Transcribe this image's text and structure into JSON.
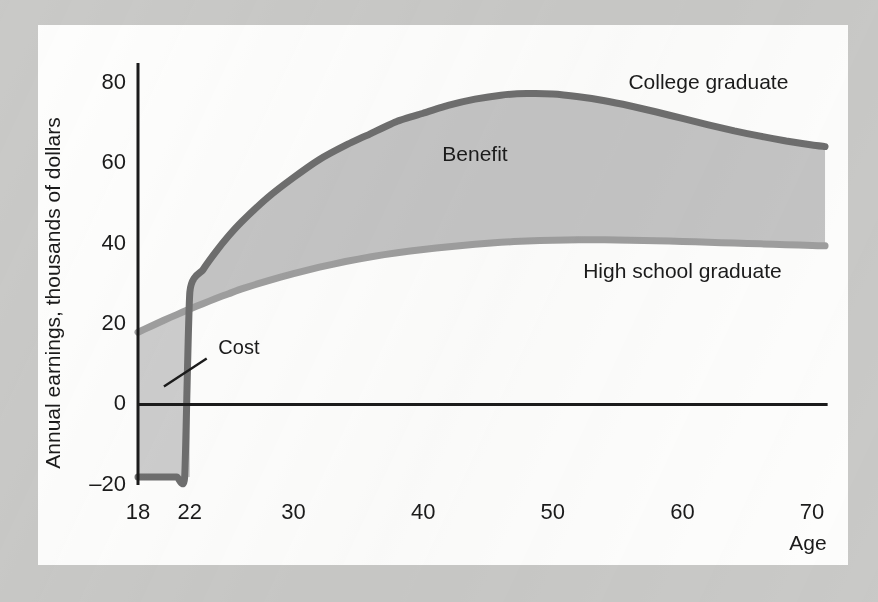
{
  "figure": {
    "background_color": "#c9c9c7",
    "panel_color": "#fdfdfc"
  },
  "chart_data": {
    "type": "line",
    "title": "",
    "subtitle": "",
    "xlabel": "Age",
    "ylabel": "Annual earnings, thousands of dollars",
    "xlim": [
      18,
      72
    ],
    "ylim": [
      -20,
      85
    ],
    "grid": false,
    "legend_position": "inline-right",
    "x_ticks": [
      18,
      22,
      30,
      40,
      50,
      60,
      70
    ],
    "x_tick_labels": [
      "18",
      "22",
      "30",
      "40",
      "50",
      "60",
      "70"
    ],
    "y_ticks": [
      -20,
      0,
      20,
      40,
      60,
      80
    ],
    "y_tick_labels": [
      "–20",
      "0",
      "20",
      "40",
      "60",
      "80"
    ],
    "zero_line": 0,
    "series": [
      {
        "name": "College graduate",
        "color": "#6e6e6e",
        "x": [
          18,
          19,
          20,
          21,
          21.6,
          22,
          23,
          24,
          25,
          26,
          28,
          30,
          32,
          34,
          36,
          38,
          40,
          42,
          44,
          46,
          48,
          50,
          52,
          54,
          56,
          58,
          60,
          62,
          64,
          66,
          68,
          70,
          71
        ],
        "y": [
          -18,
          -18,
          -18,
          -18,
          -18,
          28,
          33.5,
          38,
          42,
          45.5,
          51.5,
          56.5,
          61,
          64.5,
          67.5,
          70.5,
          72.5,
          74.5,
          76,
          77,
          77.4,
          77.3,
          76.6,
          75.6,
          74.3,
          72.8,
          71.2,
          69.6,
          68.1,
          66.8,
          65.6,
          64.6,
          64.2
        ]
      },
      {
        "name": "High school graduate",
        "color": "#9e9e9e",
        "x": [
          18,
          19,
          20,
          21,
          22,
          23,
          24,
          25,
          26,
          28,
          30,
          32,
          34,
          36,
          38,
          40,
          42,
          44,
          46,
          48,
          50,
          52,
          54,
          56,
          58,
          60,
          62,
          64,
          66,
          68,
          70,
          71
        ],
        "y": [
          18,
          19.5,
          21,
          22.4,
          23.8,
          25.1,
          26.4,
          27.6,
          28.8,
          30.8,
          32.6,
          34.2,
          35.6,
          36.8,
          37.8,
          38.6,
          39.3,
          39.9,
          40.4,
          40.7,
          40.9,
          41,
          41,
          40.9,
          40.8,
          40.6,
          40.4,
          40.2,
          40,
          39.8,
          39.6,
          39.5
        ]
      }
    ],
    "regions": [
      {
        "name": "Benefit",
        "label": "Benefit",
        "fill_color": "#c4c4c4",
        "description": "Area between the college graduate curve and the high school graduate curve from age 22 to 71"
      },
      {
        "name": "Cost",
        "label": "Cost",
        "fill_color": "#cdcdcd",
        "description": "Area between the high school graduate curve and the college graduate curve from age 18 to 22, including forgone earnings and direct costs down to –20"
      }
    ],
    "annotations": [
      {
        "name": "cost-callout",
        "text": "Cost",
        "x": 24.2,
        "y": 14,
        "leader_from": [
          23.3,
          11.5
        ],
        "leader_to": [
          20.0,
          4.5
        ]
      },
      {
        "name": "benefit-label",
        "text": "Benefit",
        "x": 44,
        "y": 62
      },
      {
        "name": "college-graduate-label",
        "text": "College graduate",
        "x": 62,
        "y": 80
      },
      {
        "name": "high-school-graduate-label",
        "text": "High school graduate",
        "x": 60,
        "y": 33
      }
    ]
  },
  "axes": {
    "y_title": "Annual earnings, thousands of dollars",
    "x_title": "Age",
    "y_labels": [
      "80",
      "60",
      "40",
      "20",
      "0",
      "–20"
    ],
    "x_labels": [
      "18",
      "22",
      "30",
      "40",
      "50",
      "60",
      "70"
    ]
  },
  "labels": {
    "college": "College graduate",
    "high_school": "High school graduate",
    "benefit": "Benefit",
    "cost": "Cost"
  }
}
